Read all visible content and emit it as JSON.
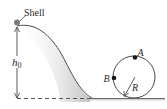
{
  "figure": {
    "labels": {
      "shell": "Shell",
      "height": "h",
      "height_sub": "0",
      "point_a": "A",
      "point_b": "B",
      "radius": "R"
    },
    "colors": {
      "line": "#4a4a4a",
      "shade": "#d4d4d4",
      "dot": "#1a1a1a",
      "dashed": "#555555"
    }
  }
}
